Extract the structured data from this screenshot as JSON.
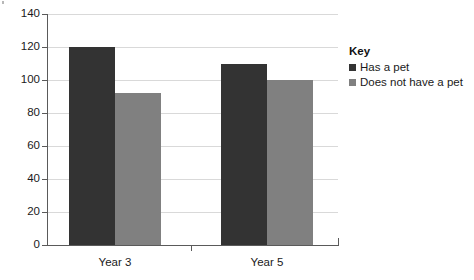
{
  "chart_data": {
    "type": "bar",
    "title": "",
    "subtitle": "",
    "xlabel": "",
    "ylabel": "",
    "categories": [
      "Year 3",
      "Year 5"
    ],
    "series": [
      {
        "name": "Has a pet",
        "values": [
          120,
          110
        ],
        "color": "#333333"
      },
      {
        "name": "Does not have a pet",
        "values": [
          92,
          100
        ],
        "color": "#808080"
      }
    ],
    "ylim": [
      0,
      140
    ],
    "y_ticks": [
      0,
      20,
      40,
      60,
      80,
      100,
      120,
      140
    ],
    "y_tick_labels": [
      "0",
      "20",
      "40",
      "60",
      "80",
      "100",
      "120",
      "140"
    ],
    "grid": true,
    "grid_axis": "y",
    "legend_position": "right"
  },
  "legend": {
    "title": "Key",
    "entries": [
      {
        "label": "Has a pet",
        "color": "#333333"
      },
      {
        "label": "Does not have a pet",
        "color": "#808080"
      }
    ]
  },
  "colors": {
    "series_dark": "#333333",
    "series_light": "#808080",
    "gridline": "#d9d9d9",
    "axis": "#5a5a5a",
    "background": "#ffffff",
    "text": "#1a1a1a"
  }
}
